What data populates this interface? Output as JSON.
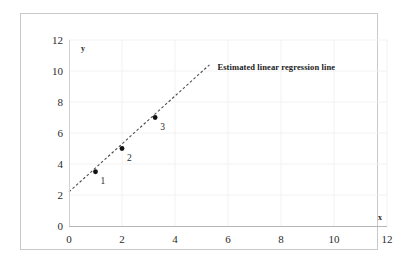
{
  "chart_data": {
    "type": "scatter",
    "title": "",
    "subtitle": "",
    "xlabel": "x",
    "ylabel": "y",
    "xlim": [
      0,
      12
    ],
    "ylim": [
      0,
      12
    ],
    "xticks": [
      0,
      2,
      4,
      6,
      8,
      10,
      12
    ],
    "yticks": [
      0,
      2,
      4,
      6,
      8,
      10,
      12
    ],
    "xtick_labels": [
      "0",
      "2",
      "4",
      "6",
      "8",
      "10",
      "12"
    ],
    "ytick_labels": [
      "0",
      "2",
      "4",
      "6",
      "8",
      "10",
      "12"
    ],
    "grid": true,
    "grid_color": "#f2f2f2",
    "legend": "none",
    "series": [
      {
        "name": "observations",
        "type": "scatter",
        "marker": "filled-circle",
        "color": "#111111",
        "points": [
          {
            "label": "1",
            "x": 1.0,
            "y": 3.5
          },
          {
            "label": "2",
            "x": 2.0,
            "y": 5.0
          },
          {
            "label": "3",
            "x": 3.25,
            "y": 7.0
          }
        ]
      },
      {
        "name": "Estimated linear regression line",
        "type": "line",
        "style": "dashed",
        "color": "#4d4d4d",
        "x_start": 0.0,
        "y_start": 2.2,
        "x_end": 5.3,
        "y_end": 10.4,
        "intercept": 2.2,
        "slope": 1.547
      }
    ],
    "annotations": [
      {
        "text": "Estimated linear regression line",
        "x": 5.6,
        "y": 10.5,
        "bold": true
      }
    ]
  },
  "axis_titles": {
    "x": "x",
    "y": "y"
  }
}
